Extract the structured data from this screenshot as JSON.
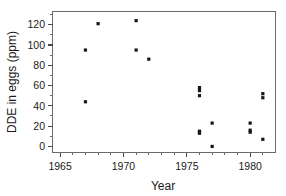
{
  "chart_data": {
    "type": "scatter",
    "title": "",
    "xlabel": "Year",
    "ylabel": "DDE in eggs (ppm)",
    "xlim": [
      1964.4,
      1982.0
    ],
    "ylim": [
      -6,
      133
    ],
    "xticks": [
      1965,
      1970,
      1975,
      1980
    ],
    "xtick_labels": [
      "1965",
      "1970",
      "1975",
      "1980"
    ],
    "yticks": [
      0,
      20,
      40,
      60,
      80,
      100,
      120
    ],
    "ytick_labels": [
      "0",
      "20",
      "40",
      "60",
      "80",
      "100",
      "120"
    ],
    "grid": false,
    "legend": false,
    "marker": "square",
    "marker_color": "#161616",
    "points": [
      {
        "x": 1967,
        "y": 95
      },
      {
        "x": 1967,
        "y": 44
      },
      {
        "x": 1968,
        "y": 121
      },
      {
        "x": 1971,
        "y": 124
      },
      {
        "x": 1971,
        "y": 95
      },
      {
        "x": 1972,
        "y": 86
      },
      {
        "x": 1976,
        "y": 58
      },
      {
        "x": 1976,
        "y": 55
      },
      {
        "x": 1976,
        "y": 50
      },
      {
        "x": 1976,
        "y": 15
      },
      {
        "x": 1976,
        "y": 14
      },
      {
        "x": 1976,
        "y": 13
      },
      {
        "x": 1977,
        "y": 23
      },
      {
        "x": 1977,
        "y": 0
      },
      {
        "x": 1980,
        "y": 23
      },
      {
        "x": 1980,
        "y": 16
      },
      {
        "x": 1980,
        "y": 14
      },
      {
        "x": 1981,
        "y": 52
      },
      {
        "x": 1981,
        "y": 48
      },
      {
        "x": 1981,
        "y": 7
      }
    ]
  },
  "axes": {
    "x_title": "Year",
    "y_title": "DDE in eggs (ppm)"
  }
}
